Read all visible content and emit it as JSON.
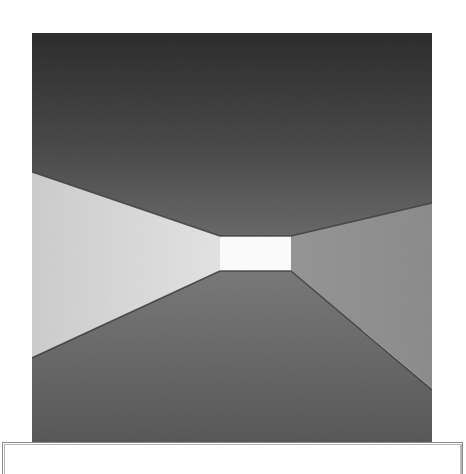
{
  "image": {
    "subject": "corridor-perspective-photograph",
    "tone": "grayscale",
    "colors": {
      "ceiling_top": "#2e2e2e",
      "ceiling_bottom": "#6a6a6a",
      "left_wall": "#cfcfcf",
      "left_wall_far": "#e6e6e6",
      "right_wall": "#8c8c8c",
      "floor_near": "#5a5a5a",
      "floor_far": "#7a7a7a",
      "far_opening": "#ffffff",
      "edge_line": "#3c3c3c"
    }
  },
  "caption": {
    "text": ""
  }
}
